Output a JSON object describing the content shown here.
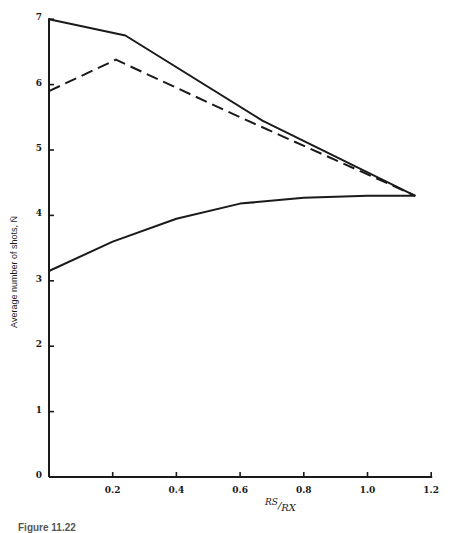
{
  "chart_data": {
    "type": "line",
    "title": "",
    "xlabel": "RS/RX",
    "xlabel_numerator": "RS",
    "xlabel_denominator": "RX",
    "ylabel": "Average number of shots, N̄",
    "xlim": [
      0,
      1.2
    ],
    "ylim": [
      0,
      7
    ],
    "x_ticks": [
      "0.2",
      "0.4",
      "0.6",
      "0.8",
      "1.0",
      "1.2"
    ],
    "y_ticks": [
      "0",
      "1",
      "2",
      "3",
      "4",
      "5",
      "6",
      "7"
    ],
    "grid": false,
    "legend": "none",
    "series": [
      {
        "name": "upper solid",
        "style": "solid",
        "points": [
          [
            0,
            7.0
          ],
          [
            0.24,
            6.75
          ],
          [
            0.67,
            5.45
          ],
          [
            1.15,
            4.3
          ]
        ]
      },
      {
        "name": "dashed",
        "style": "dashed",
        "points": [
          [
            0,
            5.9
          ],
          [
            0.21,
            6.38
          ],
          [
            0.6,
            5.5
          ],
          [
            1.15,
            4.3
          ]
        ]
      },
      {
        "name": "lower solid",
        "style": "solid",
        "points": [
          [
            0,
            3.15
          ],
          [
            0.2,
            3.6
          ],
          [
            0.4,
            3.95
          ],
          [
            0.6,
            4.18
          ],
          [
            0.8,
            4.27
          ],
          [
            1.0,
            4.3
          ],
          [
            1.15,
            4.3
          ]
        ]
      }
    ]
  },
  "caption": "Figure 11.22",
  "colors": {
    "line": "#1a1a1a",
    "background": "#ffffff"
  }
}
